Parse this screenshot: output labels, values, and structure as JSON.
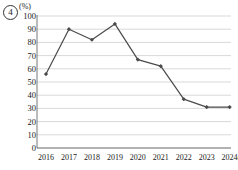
{
  "item_number": "4",
  "unit_label": "(%)",
  "chart_data": {
    "type": "line",
    "title": "",
    "xlabel": "2024(년)",
    "ylabel": "(%)",
    "unit": "%",
    "categories": [
      "2016",
      "2017",
      "2018",
      "2019",
      "2020",
      "2021",
      "2022",
      "2023",
      "2024(년)"
    ],
    "values": [
      56,
      90,
      82,
      94,
      67,
      62,
      37,
      31,
      31
    ],
    "series": [
      {
        "name": "series-1",
        "values": [
          56,
          90,
          82,
          94,
          67,
          62,
          37,
          31,
          31
        ],
        "color": "#4a4a4a",
        "marker": "diamond"
      }
    ],
    "ylim": [
      0,
      100
    ],
    "ytick_values": [
      0,
      10,
      20,
      30,
      40,
      50,
      60,
      70,
      80,
      90,
      100
    ],
    "ytick_labels": [
      "0",
      "10",
      "20",
      "30",
      "40",
      "50",
      "60",
      "70",
      "80",
      "90",
      "100"
    ],
    "grid": true,
    "grid_axis": "y",
    "legend": false,
    "legend_position": "none",
    "axis_color": "#555555",
    "grid_color": "#c8c8c8",
    "line_color": "#4a4a4a",
    "background": "#ffffff"
  }
}
